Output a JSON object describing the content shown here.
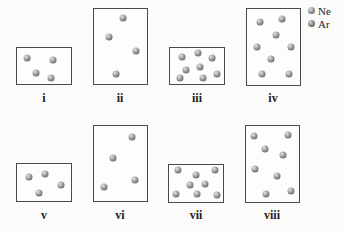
{
  "legend": [
    {
      "label": "Ne",
      "color": "#9a9a9a"
    },
    {
      "label": "Ar",
      "color": "#8a8a8a"
    }
  ],
  "containers": [
    {
      "label": "i",
      "box": {
        "x": 16,
        "y": 47,
        "w": 56,
        "h": 38
      },
      "atoms": [
        [
          27,
          58
        ],
        [
          53,
          60
        ],
        [
          36,
          73
        ],
        [
          51,
          78
        ]
      ]
    },
    {
      "label": "ii",
      "box": {
        "x": 93,
        "y": 8,
        "w": 55,
        "h": 77
      },
      "atoms": [
        [
          123,
          18
        ],
        [
          109,
          37
        ],
        [
          136,
          51
        ],
        [
          116,
          74
        ]
      ]
    },
    {
      "label": "iii",
      "box": {
        "x": 169,
        "y": 47,
        "w": 56,
        "h": 38
      },
      "atoms": [
        [
          182,
          57
        ],
        [
          198,
          53
        ],
        [
          212,
          58
        ],
        [
          186,
          70
        ],
        [
          200,
          67
        ],
        [
          180,
          78
        ],
        [
          203,
          78
        ],
        [
          217,
          74
        ]
      ]
    },
    {
      "label": "iv",
      "box": {
        "x": 246,
        "y": 8,
        "w": 55,
        "h": 78
      },
      "atoms": [
        [
          260,
          22
        ],
        [
          282,
          19
        ],
        [
          276,
          35
        ],
        [
          257,
          47
        ],
        [
          291,
          47
        ],
        [
          271,
          59
        ],
        [
          262,
          74
        ],
        [
          289,
          74
        ]
      ]
    },
    {
      "label": "v",
      "box": {
        "x": 16,
        "y": 163,
        "w": 56,
        "h": 39
      },
      "atoms": [
        [
          29,
          177
        ],
        [
          45,
          174
        ],
        [
          61,
          185
        ],
        [
          39,
          193
        ]
      ]
    },
    {
      "label": "vi",
      "box": {
        "x": 93,
        "y": 125,
        "w": 55,
        "h": 77
      },
      "atoms": [
        [
          132,
          137
        ],
        [
          113,
          158
        ],
        [
          135,
          180
        ],
        [
          104,
          187
        ]
      ]
    },
    {
      "label": "vii",
      "box": {
        "x": 168,
        "y": 164,
        "w": 56,
        "h": 39
      },
      "atoms": [
        [
          178,
          170
        ],
        [
          196,
          175
        ],
        [
          215,
          170
        ],
        [
          190,
          185
        ],
        [
          205,
          184
        ],
        [
          176,
          194
        ],
        [
          197,
          194
        ],
        [
          217,
          195
        ]
      ]
    },
    {
      "label": "viii",
      "box": {
        "x": 245,
        "y": 125,
        "w": 55,
        "h": 78
      },
      "atoms": [
        [
          254,
          136
        ],
        [
          288,
          135
        ],
        [
          265,
          149
        ],
        [
          283,
          155
        ],
        [
          255,
          169
        ],
        [
          277,
          176
        ],
        [
          266,
          194
        ],
        [
          291,
          191
        ]
      ]
    }
  ],
  "label_positions": [
    {
      "x": 44,
      "y": 91
    },
    {
      "x": 120,
      "y": 91
    },
    {
      "x": 197,
      "y": 91
    },
    {
      "x": 273,
      "y": 91
    },
    {
      "x": 44,
      "y": 208
    },
    {
      "x": 120,
      "y": 208
    },
    {
      "x": 196,
      "y": 208
    },
    {
      "x": 272,
      "y": 208
    }
  ]
}
